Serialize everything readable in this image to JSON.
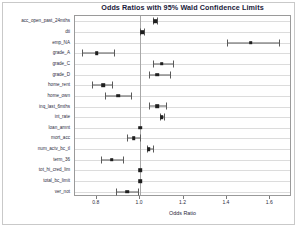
{
  "chart_data": {
    "type": "scatter",
    "title": "Odds Ratios with 95% Wald Confidence Limits",
    "xlabel": "Odds Ratio",
    "ylabel": "",
    "xlim": [
      0.7,
      1.7
    ],
    "xticks": [
      0.8,
      1.0,
      1.2,
      1.4,
      1.6
    ],
    "xticklabels": [
      "0.8",
      "1.0",
      "1.2",
      "1.4",
      "1.6"
    ],
    "grid": true,
    "reference_line": 1.0,
    "legend": "none",
    "marker_color": "#1f1f1f",
    "line_color": "#5a5a5a",
    "categories": [
      "acc_open_past_24mths",
      "dti",
      "emp_NA",
      "grade_A",
      "grade_C",
      "grade_D",
      "home_rent",
      "home_own",
      "inq_last_6mths",
      "int_rate",
      "loan_amnt",
      "mort_acc",
      "num_actv_bc_tl",
      "term_36",
      "tot_hi_cred_lim",
      "total_bc_limit",
      "ver_not"
    ],
    "odds_ratios": [
      1.07,
      1.01,
      1.51,
      0.8,
      1.1,
      1.08,
      0.83,
      0.9,
      1.08,
      1.1,
      1.0,
      0.97,
      1.04,
      0.87,
      1.0,
      1.0,
      0.94
    ],
    "ci_lower": [
      1.06,
      1.0,
      1.4,
      0.73,
      1.06,
      1.04,
      0.78,
      0.84,
      1.04,
      1.09,
      1.0,
      0.94,
      1.03,
      0.82,
      1.0,
      1.0,
      0.89
    ],
    "ci_upper": [
      1.08,
      1.02,
      1.64,
      0.88,
      1.15,
      1.14,
      0.87,
      0.96,
      1.12,
      1.11,
      1.0,
      1.0,
      1.06,
      0.92,
      1.0,
      1.0,
      0.99
    ]
  }
}
